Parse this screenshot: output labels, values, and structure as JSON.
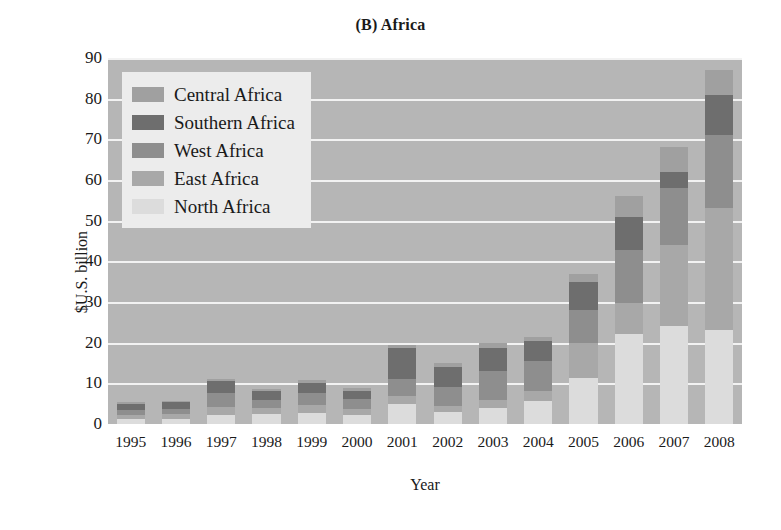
{
  "chart_data": {
    "type": "bar",
    "stacked": true,
    "title": "(B) Africa",
    "xlabel": "Year",
    "ylabel": "$U.S. billion",
    "ylim": [
      0,
      90
    ],
    "ytick_step": 10,
    "yticks": [
      "90",
      "80",
      "70",
      "60",
      "50",
      "40",
      "30",
      "20",
      "10",
      "0"
    ],
    "grid": true,
    "grid_color": "#f2f2f2",
    "plot_background": "#b6b6b6",
    "legend_position": "upper-left",
    "legend_background": "#ececec",
    "categories": [
      "1995",
      "1996",
      "1997",
      "1998",
      "1999",
      "2000",
      "2001",
      "2002",
      "2003",
      "2004",
      "2005",
      "2006",
      "2007",
      "2008"
    ],
    "series": [
      {
        "name": "North Africa",
        "color": "#dcdcdc",
        "values": [
          1.2,
          1.3,
          2.1,
          2.4,
          2.6,
          2.2,
          4.8,
          2.9,
          4.0,
          5.6,
          11.2,
          22.2,
          24.0,
          23.0
        ]
      },
      {
        "name": "East Africa",
        "color": "#a8a8a8",
        "values": [
          1.1,
          1.1,
          2.2,
          1.6,
          2.0,
          1.6,
          2.0,
          1.6,
          2.0,
          2.6,
          8.8,
          7.6,
          20.0,
          30.0
        ]
      },
      {
        "name": "West Africa",
        "color": "#8e8e8e",
        "values": [
          1.2,
          1.3,
          3.3,
          2.0,
          3.0,
          2.4,
          4.2,
          4.5,
          7.0,
          7.4,
          8.0,
          13.0,
          14.0,
          18.0
        ]
      },
      {
        "name": "Southern Africa",
        "color": "#6e6e6e",
        "values": [
          1.4,
          1.6,
          2.9,
          2.0,
          2.6,
          2.0,
          7.6,
          5.0,
          5.8,
          4.8,
          7.0,
          8.0,
          4.0,
          10.0
        ]
      },
      {
        "name": "Central Africa",
        "color": "#a0a0a0",
        "values": [
          0.4,
          0.4,
          0.5,
          0.5,
          0.6,
          0.6,
          0.8,
          0.9,
          1.2,
          1.1,
          2.0,
          5.2,
          6.0,
          6.0
        ]
      }
    ],
    "totals": [
      5.3,
      5.7,
      11.0,
      8.5,
      10.8,
      8.8,
      19.4,
      14.9,
      20.0,
      21.5,
      37.0,
      56.0,
      68.0,
      87.0
    ]
  },
  "legend": {
    "items": [
      {
        "label": "Central Africa",
        "color": "#a0a0a0"
      },
      {
        "label": "Southern Africa",
        "color": "#6e6e6e"
      },
      {
        "label": "West Africa",
        "color": "#8e8e8e"
      },
      {
        "label": "East Africa",
        "color": "#a8a8a8"
      },
      {
        "label": "North Africa",
        "color": "#dcdcdc"
      }
    ]
  }
}
